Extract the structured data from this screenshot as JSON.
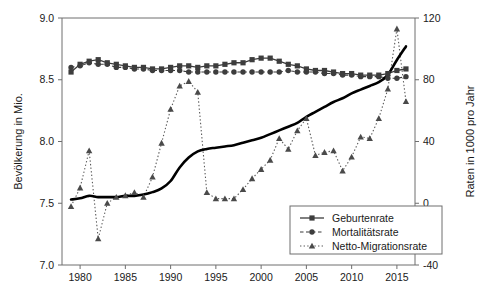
{
  "chart_data": {
    "type": "line",
    "title": "",
    "xlabel": "",
    "ylabel": "Bevölkerung in Mio.",
    "y2label": "Raten in 1000 pro Jahr",
    "xlim": [
      1978,
      2017
    ],
    "ylim": [
      7.0,
      9.0
    ],
    "y2lim": [
      -40,
      120
    ],
    "grid": false,
    "legend_position": "bottom-right",
    "x_ticks": [
      1980,
      1985,
      1990,
      1995,
      2000,
      2005,
      2010,
      2015
    ],
    "x_tick_labels": [
      "1980",
      "1985",
      "1990",
      "1995",
      "2000",
      "2005",
      "2010",
      "2015"
    ],
    "y_ticks": [
      7.0,
      7.5,
      8.0,
      8.5,
      9.0
    ],
    "y_tick_labels": [
      "7.0",
      "7.5",
      "8.0",
      "8.5",
      "9.0"
    ],
    "y2_ticks": [
      -40,
      0,
      40,
      80,
      120
    ],
    "y2_tick_labels": [
      "-40",
      "0",
      "40",
      "80",
      "120"
    ],
    "x": [
      1979,
      1980,
      1981,
      1982,
      1983,
      1984,
      1985,
      1986,
      1987,
      1988,
      1989,
      1990,
      1991,
      1992,
      1993,
      1994,
      1995,
      1996,
      1997,
      1998,
      1999,
      2000,
      2001,
      2002,
      2003,
      2004,
      2005,
      2006,
      2007,
      2008,
      2009,
      2010,
      2011,
      2012,
      2013,
      2014,
      2015,
      2016
    ],
    "series": [
      {
        "name": "Geburtenrate",
        "axis": "right",
        "marker": "square",
        "linestyle": "solid",
        "values": [
          85,
          90,
          92,
          93,
          91,
          90,
          89,
          88,
          88,
          87,
          87,
          88,
          89,
          89,
          88,
          89,
          89,
          90,
          91,
          91,
          93,
          94,
          94,
          92,
          90,
          89,
          87,
          86,
          86,
          85,
          84,
          84,
          83,
          83,
          83,
          84,
          86,
          87
        ]
      },
      {
        "name": "Mortalitätsrate",
        "axis": "right",
        "marker": "circle",
        "linestyle": "dashed",
        "values": [
          88,
          89,
          91,
          90,
          90,
          88,
          88,
          87,
          87,
          86,
          86,
          86,
          86,
          85,
          85,
          85,
          85,
          85,
          85,
          85,
          85,
          85,
          85,
          85,
          86,
          85,
          85,
          85,
          84,
          84,
          83,
          83,
          82,
          82,
          82,
          81,
          81,
          82
        ]
      },
      {
        "name": "Netto-Migrationsrate",
        "axis": "right",
        "marker": "triangle",
        "linestyle": "dotted",
        "values": [
          -2,
          10,
          34,
          -23,
          0,
          4,
          5,
          7,
          4,
          17,
          39,
          61,
          76,
          79,
          72,
          7,
          3,
          3,
          3,
          9,
          16,
          22,
          28,
          42,
          35,
          47,
          55,
          31,
          33,
          34,
          21,
          30,
          43,
          42,
          55,
          74,
          113,
          66
        ]
      }
    ],
    "population_line": {
      "name": "Bevölkerung",
      "axis": "left",
      "linestyle": "solid-thick",
      "x": [
        1979,
        1980,
        1981,
        1982,
        1983,
        1984,
        1985,
        1986,
        1987,
        1988,
        1989,
        1990,
        1991,
        1992,
        1993,
        1994,
        1995,
        1996,
        1997,
        1998,
        1999,
        2000,
        2001,
        2002,
        2003,
        2004,
        2005,
        2006,
        2007,
        2008,
        2009,
        2010,
        2011,
        2012,
        2013,
        2014,
        2015,
        2016
      ],
      "values": [
        7.53,
        7.54,
        7.56,
        7.55,
        7.55,
        7.55,
        7.56,
        7.56,
        7.57,
        7.59,
        7.62,
        7.68,
        7.79,
        7.87,
        7.92,
        7.94,
        7.95,
        7.96,
        7.97,
        7.99,
        8.01,
        8.03,
        8.06,
        8.09,
        8.12,
        8.15,
        8.2,
        8.24,
        8.28,
        8.32,
        8.35,
        8.39,
        8.42,
        8.45,
        8.48,
        8.54,
        8.66,
        8.77
      ]
    }
  },
  "legend": {
    "items": [
      {
        "label": "Geburtenrate",
        "marker": "square",
        "linestyle": "solid"
      },
      {
        "label": "Mortalitätsrate",
        "marker": "circle",
        "linestyle": "dashed"
      },
      {
        "label": "Netto-Migrationsrate",
        "marker": "triangle",
        "linestyle": "dotted"
      }
    ]
  },
  "colors": {
    "frame": "#6e6e6e",
    "text": "#1a1a1a",
    "series_birth": "#3d3d3d",
    "series_mortality": "#3d3d3d",
    "series_migration": "#4a4a4a",
    "population_line": "#000000",
    "background": "#ffffff"
  }
}
